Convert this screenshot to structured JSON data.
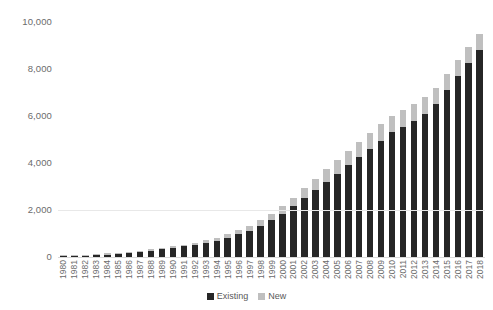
{
  "chart_data": {
    "type": "bar",
    "subtype": "stacked-column",
    "title": "",
    "subtitle": "",
    "xlabel": "",
    "ylabel": "",
    "ylim": [
      0,
      10000
    ],
    "yticks": [
      0,
      2000,
      4000,
      6000,
      8000,
      10000
    ],
    "ytick_labels": [
      "0",
      "2,000",
      "4,000",
      "6,000",
      "8,000",
      "10,000"
    ],
    "grid": "horizontal-faint",
    "legend_position": "bottom-center",
    "categories": [
      "1980",
      "1981",
      "1982",
      "1983",
      "1984",
      "1985",
      "1986",
      "1987",
      "1988",
      "1989",
      "1990",
      "1991",
      "1992",
      "1993",
      "1994",
      "1995",
      "1996",
      "1997",
      "1998",
      "1999",
      "2000",
      "2001",
      "2002",
      "2003",
      "2004",
      "2005",
      "2006",
      "2007",
      "2008",
      "2009",
      "2010",
      "2011",
      "2012",
      "2013",
      "2014",
      "2015",
      "2016",
      "2017",
      "2018"
    ],
    "series": [
      {
        "name": "Existing",
        "color": "#262626",
        "values": [
          30,
          40,
          55,
          75,
          100,
          130,
          170,
          215,
          270,
          330,
          390,
          450,
          520,
          600,
          700,
          820,
          960,
          1120,
          1320,
          1560,
          1850,
          2150,
          2500,
          2850,
          3200,
          3550,
          3900,
          4250,
          4600,
          4950,
          5300,
          5550,
          5800,
          6100,
          6500,
          7100,
          7700,
          8250,
          8800
        ]
      },
      {
        "name": "New",
        "color": "#bfbfbf",
        "values": [
          10,
          12,
          15,
          18,
          22,
          28,
          35,
          42,
          50,
          60,
          70,
          80,
          95,
          110,
          130,
          150,
          175,
          205,
          240,
          285,
          330,
          380,
          430,
          480,
          530,
          570,
          610,
          640,
          670,
          690,
          700,
          700,
          700,
          700,
          700,
          700,
          700,
          700,
          700
        ]
      }
    ]
  },
  "legend": {
    "items": [
      {
        "label": "Existing",
        "swatch": "existing"
      },
      {
        "label": "New",
        "swatch": "new"
      }
    ]
  }
}
